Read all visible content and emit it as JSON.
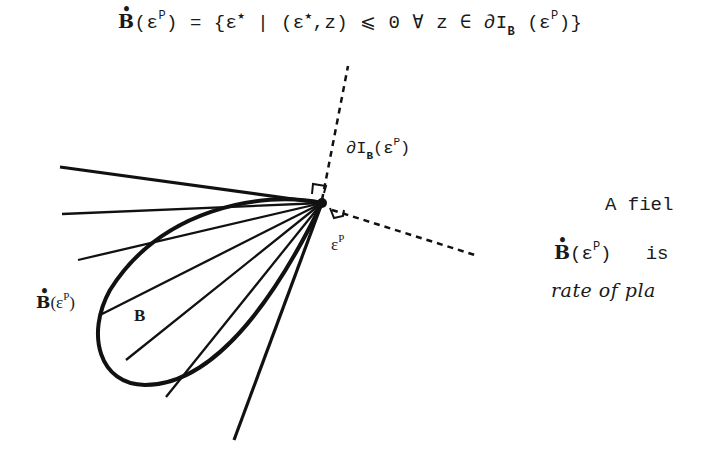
{
  "formula": {
    "lhs_symbol": "B",
    "lhs_arg": "(ε",
    "lhs_sup": "P",
    "lhs_close": ")",
    "equals": " = {ε",
    "star1": "★",
    "bar": " | (ε",
    "star2": "★",
    "pair_rest": ",z) ⩽ 0    ∀ z ∈ ∂I",
    "sub_B": "B",
    "tail_open": " (ε",
    "tail_sup": "P",
    "tail_close": ")}"
  },
  "diagram": {
    "label_subdiff_prefix": "∂I",
    "label_subdiff_sub": "B",
    "label_subdiff_open": "(ε",
    "label_subdiff_sup": "P",
    "label_subdiff_close": ")",
    "label_vertex_base": "ε",
    "label_vertex_sup": "P",
    "label_cone_symbol": "B",
    "label_cone_open": "(ε",
    "label_cone_sup": "P",
    "label_cone_close": ")",
    "label_set": "B"
  },
  "side_text": {
    "line1": "A fiel",
    "line2_symbol": "B",
    "line2_open": "(ε",
    "line2_sup": "P",
    "line2_close": ")",
    "line2_rest": "is",
    "line3": "rate of pla"
  }
}
